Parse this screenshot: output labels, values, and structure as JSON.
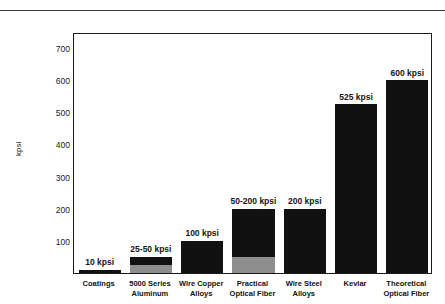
{
  "page": {
    "top_artifact_text": "·  ·   ·"
  },
  "chart_data": {
    "type": "bar",
    "title": "",
    "subtitle": "",
    "xlabel": "",
    "ylabel": "kpsi",
    "ylim": [
      0,
      750
    ],
    "grid": false,
    "legend": "none",
    "y_ticks": [
      700,
      600,
      500,
      400,
      300,
      200,
      100
    ],
    "categories": [
      "Coatings",
      "5000 Series Aluminum",
      "Wire Copper Alloys",
      "Practical Optical Fiber",
      "Wire Steel Alloys",
      "Kevlar",
      "Theoretical Optical Fiber"
    ],
    "values": [
      10,
      50,
      100,
      200,
      200,
      525,
      600
    ],
    "bars": [
      {
        "category": "Coatings",
        "label_line1": "Coatings",
        "label_line2": "",
        "value_label": "10 kpsi",
        "low": 10,
        "high": 10,
        "top": 10,
        "range_base": 0
      },
      {
        "category": "5000 Series Aluminum",
        "label_line1": "5000 Series",
        "label_line2": "Aluminum",
        "value_label": "25-50 kpsi",
        "low": 25,
        "high": 50,
        "top": 50,
        "range_base": 25
      },
      {
        "category": "Wire Copper Alloys",
        "label_line1": "Wire Copper",
        "label_line2": "Alloys",
        "value_label": "100 kpsi",
        "low": 100,
        "high": 100,
        "top": 100,
        "range_base": 0
      },
      {
        "category": "Practical Optical Fiber",
        "label_line1": "Practical",
        "label_line2": "Optical Fiber",
        "value_label": "50-200 kpsi",
        "low": 50,
        "high": 200,
        "top": 200,
        "range_base": 50
      },
      {
        "category": "Wire Steel Alloys",
        "label_line1": "Wire Steel",
        "label_line2": "Alloys",
        "value_label": "200 kpsi",
        "low": 200,
        "high": 200,
        "top": 200,
        "range_base": 0
      },
      {
        "category": "Kevlar",
        "label_line1": "Kevlar",
        "label_line2": "",
        "value_label": "525 kpsi",
        "low": 525,
        "high": 525,
        "top": 525,
        "range_base": 0
      },
      {
        "category": "Theoretical Optical Fiber",
        "label_line1": "Theoretical",
        "label_line2": "Optical Fiber",
        "value_label": "600 kpsi",
        "low": 600,
        "high": 600,
        "top": 600,
        "range_base": 0
      }
    ],
    "colors": {
      "bar_dark": "#111111",
      "bar_light": "#8e8e8e",
      "axis": "#1a1a1a",
      "text": "#111111",
      "background": "#ffffff"
    }
  }
}
